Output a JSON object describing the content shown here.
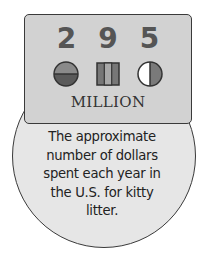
{
  "card": {
    "digits": [
      "2",
      "9",
      "5"
    ],
    "unit_label": "MILLION",
    "icons": [
      "half-filled-circle-horizontal-icon",
      "three-bar-box-icon",
      "half-filled-circle-vertical-icon"
    ]
  },
  "caption": {
    "lines": [
      "The approximate",
      "number of dollars",
      "spent each year in",
      "the U.S. for kitty",
      "litter."
    ]
  },
  "colors": {
    "card_bg": "#d2d2d2",
    "circle_bg": "#e6e6e6",
    "digit": "#555555",
    "outline": "#3a3a3a"
  }
}
